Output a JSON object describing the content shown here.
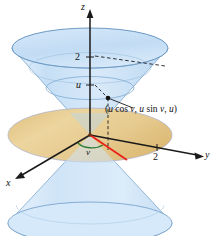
{
  "figure": {
    "name": "double-cone-parametric-surface",
    "width": 217,
    "height": 236
  },
  "axes": {
    "z_label": "z",
    "y_label": "y",
    "x_label": "x",
    "z_tick_2": "2",
    "z_tick_u": "u",
    "y_tick_2": "2"
  },
  "annotations": {
    "point_label_open": "(",
    "point_label": "(u cos v, u sin v, u)",
    "point_label_parts": {
      "u1": "u",
      "cos": " cos ",
      "v1": "v",
      "sep1": ", ",
      "u2": "u",
      "sin": " sin ",
      "v2": "v",
      "sep2": ", ",
      "u3": "u",
      "close": ")"
    },
    "angle_label": "v"
  },
  "colors": {
    "cone_fill": "#cfe4f7",
    "cone_fill_light": "#e3f0fb",
    "cone_stroke": "#5a88b5",
    "disk_fill": "#e8c98b",
    "disk_stroke": "#9a7c45",
    "axis": "#1a1a1a",
    "radial_line": "#e8241c",
    "angle_arc": "#2f7d32",
    "dashed": "#1a1a1a",
    "background": "#ffffff"
  },
  "geometry": {
    "origin": {
      "x": 90,
      "y": 135
    },
    "top_rim_cy": 48,
    "top_rim_rx": 78,
    "top_rim_ry": 20,
    "mid_rim_cy": 88,
    "mid_rim_rx": 44,
    "mid_rim_ry": 11,
    "disk_cy": 135,
    "disk_rx": 82,
    "disk_ry": 27,
    "bottom_rim_cy": 223,
    "bottom_rim_rx": 82,
    "bottom_rim_ry": 21,
    "point": {
      "x": 108,
      "y": 98
    }
  }
}
